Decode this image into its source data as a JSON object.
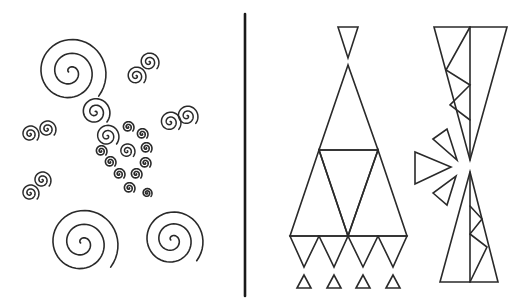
{
  "figure": {
    "colors": {
      "ink": "#2a2a2a",
      "background": "#ffffff"
    },
    "divider": {
      "x": 245,
      "y1": 14,
      "y2": 296
    },
    "left_panel": {
      "name": "spirals",
      "spirals": [
        {
          "cx": 70,
          "cy": 72,
          "r": 36,
          "turns": 2.6,
          "rot": -40,
          "w": 1.6
        },
        {
          "cx": 82,
          "cy": 243,
          "r": 36,
          "turns": 2.6,
          "rot": -40,
          "w": 1.6
        },
        {
          "cx": 172,
          "cy": 240,
          "r": 31,
          "turns": 2.6,
          "rot": -40,
          "w": 1.6
        },
        {
          "cx": 95,
          "cy": 112,
          "r": 15,
          "turns": 2.3,
          "rot": -40,
          "w": 1.6
        },
        {
          "cx": 107,
          "cy": 136,
          "r": 12,
          "turns": 2.3,
          "rot": -40,
          "w": 1.5
        },
        {
          "cx": 136,
          "cy": 76,
          "r": 10,
          "turns": 2.3,
          "rot": -40,
          "w": 1.5
        },
        {
          "cx": 149,
          "cy": 62,
          "r": 10,
          "turns": 2.3,
          "rot": -40,
          "w": 1.5
        },
        {
          "cx": 170,
          "cy": 122,
          "r": 11,
          "turns": 2.3,
          "rot": -40,
          "w": 1.5
        },
        {
          "cx": 187,
          "cy": 116,
          "r": 11,
          "turns": 2.3,
          "rot": -40,
          "w": 1.5
        },
        {
          "cx": 30,
          "cy": 134,
          "r": 9,
          "turns": 2.3,
          "rot": -40,
          "w": 1.5
        },
        {
          "cx": 47,
          "cy": 129,
          "r": 9,
          "turns": 2.3,
          "rot": -40,
          "w": 1.5
        },
        {
          "cx": 30,
          "cy": 193,
          "r": 9,
          "turns": 2.3,
          "rot": -40,
          "w": 1.5
        },
        {
          "cx": 42,
          "cy": 180,
          "r": 9,
          "turns": 2.3,
          "rot": -40,
          "w": 1.5
        },
        {
          "cx": 128,
          "cy": 127,
          "r": 6,
          "turns": 2.2,
          "rot": -40,
          "w": 1.6
        },
        {
          "cx": 142,
          "cy": 134,
          "r": 6,
          "turns": 2.2,
          "rot": -40,
          "w": 1.6
        },
        {
          "cx": 101,
          "cy": 151,
          "r": 6,
          "turns": 2.2,
          "rot": -40,
          "w": 1.6
        },
        {
          "cx": 127,
          "cy": 151,
          "r": 8,
          "turns": 2.2,
          "rot": -40,
          "w": 1.5
        },
        {
          "cx": 146,
          "cy": 148,
          "r": 6,
          "turns": 2.2,
          "rot": -40,
          "w": 1.6
        },
        {
          "cx": 110,
          "cy": 162,
          "r": 6,
          "turns": 2.2,
          "rot": -40,
          "w": 1.6
        },
        {
          "cx": 145,
          "cy": 163,
          "r": 6,
          "turns": 2.2,
          "rot": -40,
          "w": 1.6
        },
        {
          "cx": 119,
          "cy": 174,
          "r": 6,
          "turns": 2.2,
          "rot": -40,
          "w": 1.6
        },
        {
          "cx": 136,
          "cy": 174,
          "r": 6,
          "turns": 2.2,
          "rot": -40,
          "w": 1.6
        },
        {
          "cx": 129,
          "cy": 188,
          "r": 6,
          "turns": 2.2,
          "rot": -40,
          "w": 1.6
        },
        {
          "cx": 147,
          "cy": 193,
          "r": 5,
          "turns": 2.2,
          "rot": -40,
          "w": 1.6
        }
      ]
    },
    "right_panel": {
      "name": "triangles",
      "polygons": [
        {
          "id": "top-small-inverted",
          "points": "338,27 358,27 348,58"
        },
        {
          "id": "apex-triangle",
          "points": "348,65 319,150 378,150"
        },
        {
          "id": "row2-left",
          "points": "319,150 290,236 348,236"
        },
        {
          "id": "row2-right",
          "points": "378,150 348,236 407,236"
        },
        {
          "id": "row2-middle-inverted",
          "points": "319,150 378,150 348,236"
        },
        {
          "id": "row3-inv-1",
          "points": "290,236 319,236 304,267"
        },
        {
          "id": "row3-inv-2",
          "points": "319,236 348,236 334,267"
        },
        {
          "id": "row3-inv-3",
          "points": "348,236 378,236 363,267"
        },
        {
          "id": "row3-inv-4",
          "points": "378,236 407,236 393,267"
        },
        {
          "id": "bottom-small-1",
          "points": "304,275 297,288 311,288"
        },
        {
          "id": "bottom-small-2",
          "points": "334,275 327,288 341,288"
        },
        {
          "id": "bottom-small-3",
          "points": "363,275 356,288 370,288"
        },
        {
          "id": "bottom-small-4",
          "points": "393,275 386,288 400,288"
        },
        {
          "id": "tall-inverted",
          "points": "434,27 507,27 470,160"
        },
        {
          "id": "tall-upright",
          "points": "470,172 440,282 498,282"
        },
        {
          "id": "side-upper",
          "points": "433,139 447,129 457,160"
        },
        {
          "id": "side-left",
          "points": "415,152 415,184 451,167"
        },
        {
          "id": "side-lower",
          "points": "433,193 447,205 456,176"
        }
      ],
      "lines": [
        {
          "id": "tall-inverted-axis",
          "points": "470,27 470,160"
        },
        {
          "id": "tall-inverted-zigzag",
          "points": "470,27 446,70 470,85 450,105 470,120"
        },
        {
          "id": "tall-upright-axis",
          "points": "470,172 470,282"
        },
        {
          "id": "tall-upright-zigzag",
          "points": "470,206 482,219 470,234 487,247 470,282"
        }
      ]
    }
  }
}
